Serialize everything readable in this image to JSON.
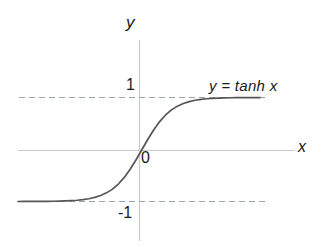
{
  "figure": {
    "background_color": "#ffffff",
    "width": 325,
    "height": 247
  },
  "axes": {
    "x_axis_label": "x",
    "y_axis_label": "y",
    "axis_color": "#c9c9c9",
    "origin_label": "0"
  },
  "ticks": {
    "y_positive_one": "1",
    "y_negative_one": "-1"
  },
  "annotation": {
    "curve_label": "y = tanh x"
  },
  "chart_data": {
    "type": "line",
    "title": "",
    "xlabel": "x",
    "ylabel": "y",
    "xlim": [
      -4.2,
      4.1
    ],
    "ylim": [
      -1.8,
      1.65
    ],
    "grid": false,
    "legend_position": "inline-right",
    "curve_color": "#565656",
    "asymptote_color": "#9aa3ad",
    "asymptotes": [
      1,
      -1
    ],
    "ytick_labels": [
      "1",
      "-1"
    ],
    "ytick_values": [
      1,
      -1
    ],
    "xtick_labels": [
      "0"
    ],
    "xtick_values": [
      0
    ],
    "series": [
      {
        "name": "y = tanh x",
        "x": [
          -4.2,
          -4.0,
          -3.8,
          -3.6,
          -3.4,
          -3.2,
          -3.0,
          -2.8,
          -2.6,
          -2.4,
          -2.2,
          -2.0,
          -1.8,
          -1.6,
          -1.4,
          -1.2,
          -1.0,
          -0.8,
          -0.6,
          -0.4,
          -0.2,
          0.0,
          0.2,
          0.4,
          0.6,
          0.8,
          1.0,
          1.2,
          1.4,
          1.6,
          1.8,
          2.0,
          2.2,
          2.4,
          2.6,
          2.8,
          3.0,
          3.2,
          3.4,
          3.6,
          3.8,
          4.0
        ],
        "y": [
          -0.9996,
          -0.9993,
          -0.999,
          -0.9985,
          -0.9978,
          -0.9967,
          -0.9951,
          -0.9926,
          -0.989,
          -0.9837,
          -0.9757,
          -0.964,
          -0.9468,
          -0.9217,
          -0.8854,
          -0.8337,
          -0.7616,
          -0.664,
          -0.537,
          -0.3799,
          -0.1974,
          0.0,
          0.1974,
          0.3799,
          0.537,
          0.664,
          0.7616,
          0.8337,
          0.8854,
          0.9217,
          0.9468,
          0.964,
          0.9757,
          0.9837,
          0.989,
          0.9926,
          0.9951,
          0.9967,
          0.9978,
          0.9985,
          0.999,
          0.9993
        ]
      }
    ]
  }
}
